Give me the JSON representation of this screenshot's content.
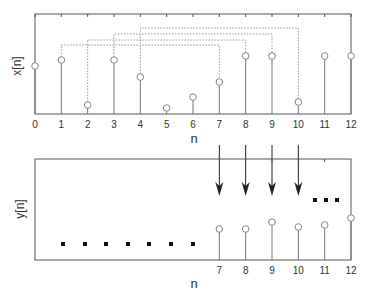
{
  "top_plot": {
    "ylabel": "x[n]",
    "xlabel": "n",
    "tick_labels": [
      "0",
      "1",
      "2",
      "3",
      "4",
      "5",
      "6",
      "7",
      "8",
      "9",
      "10",
      "11",
      "12"
    ],
    "samples_y_px": [
      66,
      60,
      105,
      60,
      77,
      108,
      97,
      82,
      56,
      56,
      102,
      56,
      56
    ]
  },
  "bottom_plot": {
    "ylabel": "y[n]",
    "xlabel": "n",
    "tick_labels": [
      "7",
      "8",
      "9",
      "10",
      "11",
      "12"
    ],
    "samples": [
      {
        "n": 7,
        "y_px": 229
      },
      {
        "n": 8,
        "y_px": 229
      },
      {
        "n": 9,
        "y_px": 222
      },
      {
        "n": 10,
        "y_px": 227
      },
      {
        "n": 11,
        "y_px": 225
      },
      {
        "n": 12,
        "y_px": 218
      }
    ],
    "ellipsis_left_count": 7,
    "ellipsis_right_count": 3
  },
  "mappings": [
    {
      "from_n": 1,
      "to_n": 7,
      "line_y": 45
    },
    {
      "from_n": 2,
      "to_n": 8,
      "line_y": 40
    },
    {
      "from_n": 3,
      "to_n": 9,
      "line_y": 34
    },
    {
      "from_n": 4,
      "to_n": 10,
      "line_y": 28
    }
  ],
  "colors": {
    "axis": "#555555",
    "stem": "#777777",
    "marker": "#888888",
    "dashed": "#999999",
    "arrow": "#222222",
    "dots": "#111111"
  }
}
